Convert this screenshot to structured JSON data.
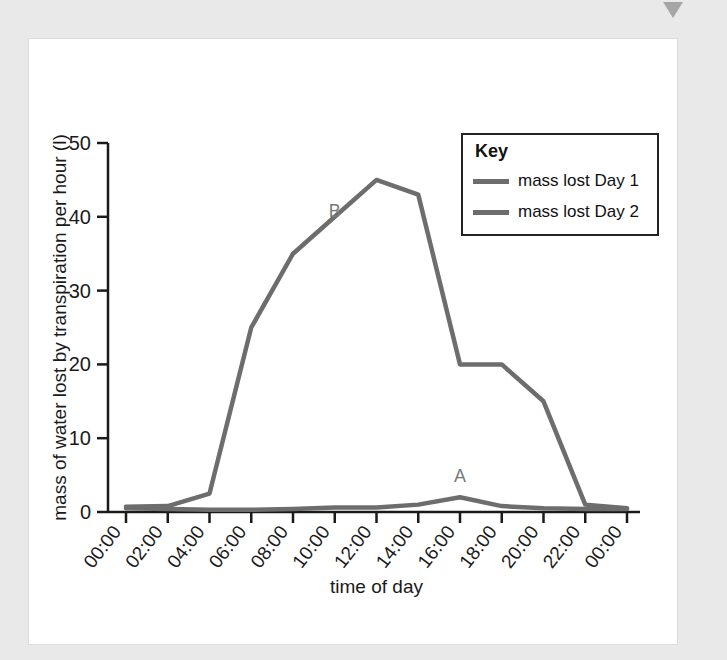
{
  "page": {
    "background_color": "#e9e9e9",
    "card_background": "#ffffff",
    "marker_icon": "triangle-down-icon"
  },
  "legend": {
    "title": "Key",
    "entries": [
      {
        "label": "mass lost Day 1",
        "color": "#6d6d6d"
      },
      {
        "label": "mass lost Day 2",
        "color": "#6d6d6d"
      }
    ]
  },
  "annotations": [
    {
      "text": "B",
      "x_value": "10:00",
      "y_value": 40
    },
    {
      "text": "A",
      "x_value": "16:00",
      "y_value": 4
    }
  ],
  "chart_data": {
    "type": "line",
    "title": "",
    "xlabel": "time of day",
    "ylabel": "mass of water lost by transpiration per hour (l)",
    "categories": [
      "00:00",
      "02:00",
      "04:00",
      "06:00",
      "08:00",
      "10:00",
      "12:00",
      "14:00",
      "16:00",
      "18:00",
      "20:00",
      "22:00",
      "00:00"
    ],
    "x_tick_labels": [
      "00:00",
      "02:00",
      "04:00",
      "06:00",
      "08:00",
      "10:00",
      "12:00",
      "14:00",
      "16:00",
      "18:00",
      "20:00",
      "22:00",
      "00:00"
    ],
    "y_tick_labels": [
      "0",
      "10",
      "20",
      "30",
      "40",
      "50"
    ],
    "y_ticks": [
      0,
      10,
      20,
      30,
      40,
      50
    ],
    "ylim": [
      0,
      50
    ],
    "grid": false,
    "legend_position": "top-right",
    "series": [
      {
        "name": "mass lost Day 1",
        "annotation": "A",
        "color": "#6d6d6d",
        "values": [
          0.5,
          0.4,
          0.3,
          0.3,
          0.4,
          0.6,
          0.6,
          1.0,
          2.0,
          0.8,
          0.5,
          0.4,
          0.4
        ]
      },
      {
        "name": "mass lost Day 2",
        "annotation": "B",
        "color": "#6d6d6d",
        "values": [
          0.7,
          0.8,
          2.5,
          25.0,
          35.0,
          40.0,
          45.0,
          43.0,
          20.0,
          20.0,
          15.0,
          1.0,
          0.5
        ]
      }
    ]
  }
}
